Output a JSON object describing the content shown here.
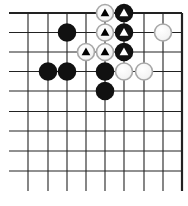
{
  "board": {
    "title": "Go problem diagram",
    "columns": 9,
    "rows": 9,
    "col_x": [
      28,
      48,
      67,
      86,
      105,
      124,
      144,
      163,
      182
    ],
    "row_y": [
      13,
      32.5,
      52,
      71.5,
      91,
      111.5,
      131,
      151,
      171
    ],
    "line_left": 9,
    "line_bottom": 191,
    "top_edge": true,
    "right_edge": true,
    "stone_radius": 9.3,
    "colors": {
      "line": "#222222",
      "black_stone": "#111111",
      "white_stone_fill": "#ffffff",
      "white_stone_border": "#a8a8a8",
      "mark_on_white": "#000000",
      "mark_on_black": "#ffffff"
    },
    "stones": [
      {
        "color": "white",
        "col": 4,
        "row": 0,
        "mark": "triangle"
      },
      {
        "color": "black",
        "col": 5,
        "row": 0,
        "mark": "triangle"
      },
      {
        "color": "black",
        "col": 2,
        "row": 1,
        "mark": ""
      },
      {
        "color": "white",
        "col": 4,
        "row": 1,
        "mark": "triangle"
      },
      {
        "color": "black",
        "col": 5,
        "row": 1,
        "mark": "triangle"
      },
      {
        "color": "white",
        "col": 7,
        "row": 1,
        "mark": ""
      },
      {
        "color": "white",
        "col": 3,
        "row": 2,
        "mark": "triangle"
      },
      {
        "color": "white",
        "col": 4,
        "row": 2,
        "mark": "triangle"
      },
      {
        "color": "black",
        "col": 5,
        "row": 2,
        "mark": "triangle"
      },
      {
        "color": "black",
        "col": 1,
        "row": 3,
        "mark": ""
      },
      {
        "color": "black",
        "col": 2,
        "row": 3,
        "mark": ""
      },
      {
        "color": "black",
        "col": 4,
        "row": 3,
        "mark": ""
      },
      {
        "color": "white",
        "col": 5,
        "row": 3,
        "mark": ""
      },
      {
        "color": "white",
        "col": 6,
        "row": 3,
        "mark": ""
      },
      {
        "color": "black",
        "col": 4,
        "row": 4,
        "mark": ""
      }
    ]
  }
}
